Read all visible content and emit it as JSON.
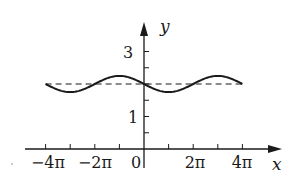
{
  "chart_data": {
    "type": "line",
    "title": "",
    "xlabel": "x",
    "ylabel": "y",
    "function": "y = 2 - 0.25 sin(x/2)",
    "xlim": [
      -12.566,
      12.566
    ],
    "ylim": [
      0,
      3.4
    ],
    "x_ticks": [
      -12.566,
      -9.425,
      -6.283,
      -3.142,
      0,
      3.142,
      6.283,
      9.425,
      12.566
    ],
    "x_tick_labels": [
      "-4π",
      "",
      "-2π",
      "",
      "0",
      "",
      "2π",
      "",
      "4π"
    ],
    "y_ticks": [
      0.5,
      1,
      1.5,
      2,
      2.5,
      3
    ],
    "y_tick_labels": [
      "",
      "1",
      "",
      "",
      "",
      "3"
    ],
    "series": [
      {
        "name": "curve",
        "style": "solid",
        "x": [
          -12.566,
          -9.425,
          -6.283,
          -3.142,
          0,
          3.142,
          6.283,
          9.425,
          12.566
        ],
        "values": [
          2.0,
          1.75,
          2.0,
          2.25,
          2.0,
          1.75,
          2.0,
          2.25,
          2.0
        ]
      },
      {
        "name": "asymptote y=2",
        "style": "dashed",
        "x": [
          -12.566,
          12.566
        ],
        "values": [
          2,
          2
        ]
      }
    ],
    "grid": false,
    "legend": null
  },
  "labels": {
    "x_axis": "x",
    "y_axis": "y",
    "x_tick_neg4pi": "−4π",
    "x_tick_neg2pi": "−2π",
    "x_tick_zero": "0",
    "x_tick_2pi": "2π",
    "x_tick_4pi": "4π",
    "y_tick_1": "1",
    "y_tick_3": "3"
  }
}
